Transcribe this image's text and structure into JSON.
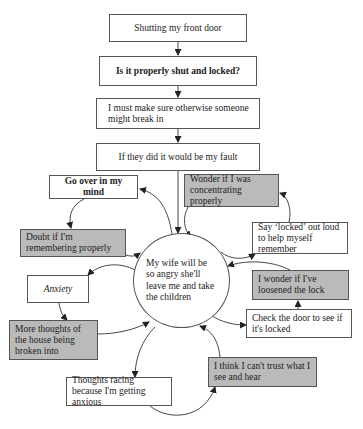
{
  "diagram": {
    "type": "vicious-cycle flowchart",
    "linear_chain": [
      {
        "id": "n1",
        "label": "Shutting my front door",
        "style": "plain"
      },
      {
        "id": "n2",
        "label": "Is it properly shut and locked?",
        "style": "bold"
      },
      {
        "id": "n3",
        "label": "I must make sure otherwise someone might break in",
        "style": "plain"
      },
      {
        "id": "n4",
        "label": "If they did it would be my fault",
        "style": "plain"
      }
    ],
    "center": {
      "id": "c",
      "label": "My wife will be so angry she'll leave me and take the children"
    },
    "cycle_nodes": [
      {
        "id": "go_over",
        "label": "Go over in my mind",
        "style": "bold"
      },
      {
        "id": "doubt",
        "label": "Doubt if I'm remembering properly",
        "style": "gray"
      },
      {
        "id": "anxiety",
        "label": "Anxiety",
        "style": "italic"
      },
      {
        "id": "more_thoughts",
        "label": "More thoughts of the house being broken into",
        "style": "gray"
      },
      {
        "id": "racing",
        "label": "Thoughts racing because I'm getting anxious",
        "style": "plain"
      },
      {
        "id": "trust",
        "label": "I think I can't trust what I see and hear",
        "style": "gray"
      },
      {
        "id": "check",
        "label": "Check the door to see if it's locked",
        "style": "plain"
      },
      {
        "id": "loosened",
        "label": "I wonder if I've loosened the lock",
        "style": "gray"
      },
      {
        "id": "say_locked",
        "label": "Say ‘locked’ out loud to help myself remember",
        "style": "plain"
      },
      {
        "id": "wonder",
        "label": "Wonder if I was concentrating properly",
        "style": "gray"
      }
    ],
    "edges": [
      [
        "n1",
        "n2"
      ],
      [
        "n2",
        "n3"
      ],
      [
        "n3",
        "n4"
      ],
      [
        "n4",
        "c"
      ],
      [
        "c",
        "go_over"
      ],
      [
        "go_over",
        "doubt"
      ],
      [
        "doubt",
        "c"
      ],
      [
        "c",
        "anxiety"
      ],
      [
        "anxiety",
        "more_thoughts"
      ],
      [
        "more_thoughts",
        "c"
      ],
      [
        "c",
        "racing"
      ],
      [
        "racing",
        "trust"
      ],
      [
        "trust",
        "c"
      ],
      [
        "c",
        "check"
      ],
      [
        "check",
        "loosened"
      ],
      [
        "loosened",
        "c"
      ],
      [
        "c",
        "say_locked"
      ],
      [
        "say_locked",
        "wonder"
      ],
      [
        "wonder",
        "c"
      ]
    ],
    "colors": {
      "gray_fill": "#bababa",
      "border": "#555555",
      "arrow": "#333333"
    }
  }
}
